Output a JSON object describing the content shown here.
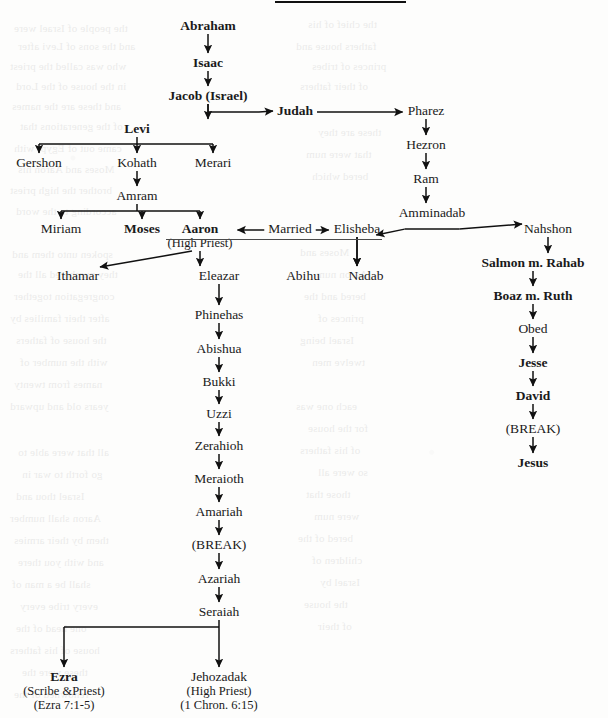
{
  "chart_data": {
    "type": "diagram",
    "nodes": [
      {
        "id": "abraham",
        "label": "Abraham",
        "x": 208,
        "y": 18,
        "bold": true
      },
      {
        "id": "isaac",
        "label": "Isaac",
        "x": 208,
        "y": 55,
        "bold": true
      },
      {
        "id": "jacob",
        "label": "Jacob (Israel)",
        "x": 208,
        "y": 88,
        "bold": true
      },
      {
        "id": "judah",
        "label": "Judah",
        "x": 295,
        "y": 103,
        "bold": true
      },
      {
        "id": "pharez",
        "label": "Pharez",
        "x": 426,
        "y": 103,
        "bold": false
      },
      {
        "id": "hezron",
        "label": "Hezron",
        "x": 426,
        "y": 137,
        "bold": false
      },
      {
        "id": "ram",
        "label": "Ram",
        "x": 426,
        "y": 171,
        "bold": false
      },
      {
        "id": "amminadab",
        "label": "Amminadab",
        "x": 432,
        "y": 205,
        "bold": false
      },
      {
        "id": "levi",
        "label": "Levi",
        "x": 137,
        "y": 121,
        "bold": true
      },
      {
        "id": "gershon",
        "label": "Gershon",
        "x": 39,
        "y": 155,
        "bold": false
      },
      {
        "id": "kohath",
        "label": "Kohath",
        "x": 137,
        "y": 155,
        "bold": false
      },
      {
        "id": "merari",
        "label": "Merari",
        "x": 213,
        "y": 155,
        "bold": false
      },
      {
        "id": "amram",
        "label": "Amram",
        "x": 137,
        "y": 188,
        "bold": false
      },
      {
        "id": "miriam",
        "label": "Miriam",
        "x": 61,
        "y": 221,
        "bold": false
      },
      {
        "id": "moses",
        "label": "Moses",
        "x": 142,
        "y": 221,
        "bold": true
      },
      {
        "id": "aaron",
        "label": "Aaron",
        "sub": "(High Priest)",
        "x": 200,
        "y": 221,
        "bold": true
      },
      {
        "id": "married",
        "label": "Married",
        "x": 290,
        "y": 221,
        "bold": false
      },
      {
        "id": "elisheba",
        "label": "Elisheba",
        "x": 357,
        "y": 221,
        "bold": false
      },
      {
        "id": "nahshon",
        "label": "Nahshon",
        "x": 548,
        "y": 221,
        "bold": false
      },
      {
        "id": "ithamar",
        "label": "Ithamar",
        "x": 78,
        "y": 268,
        "bold": false
      },
      {
        "id": "eleazar",
        "label": "Eleazar",
        "x": 219,
        "y": 268,
        "bold": false
      },
      {
        "id": "abihu",
        "label": "Abihu",
        "x": 303,
        "y": 268,
        "bold": false
      },
      {
        "id": "nadab",
        "label": "Nadab",
        "x": 366,
        "y": 268,
        "bold": false
      },
      {
        "id": "salmon",
        "label": "Salmon m. Rahab",
        "x": 533,
        "y": 255,
        "bold": true
      },
      {
        "id": "boaz",
        "label": "Boaz m. Ruth",
        "x": 533,
        "y": 288,
        "bold": true
      },
      {
        "id": "obed",
        "label": "Obed",
        "x": 533,
        "y": 321,
        "bold": false
      },
      {
        "id": "jesse",
        "label": "Jesse",
        "x": 533,
        "y": 355,
        "bold": true
      },
      {
        "id": "david",
        "label": "David",
        "x": 533,
        "y": 388,
        "bold": true
      },
      {
        "id": "break_d",
        "label": "(BREAK)",
        "x": 533,
        "y": 421,
        "bold": false
      },
      {
        "id": "jesus",
        "label": "Jesus",
        "x": 533,
        "y": 455,
        "bold": true
      },
      {
        "id": "phinehas",
        "label": "Phinehas",
        "x": 219,
        "y": 307,
        "bold": false
      },
      {
        "id": "abishua",
        "label": "Abishua",
        "x": 219,
        "y": 341,
        "bold": false
      },
      {
        "id": "bukki",
        "label": "Bukki",
        "x": 219,
        "y": 374,
        "bold": false
      },
      {
        "id": "uzzi",
        "label": "Uzzi",
        "x": 219,
        "y": 406,
        "bold": false
      },
      {
        "id": "zerahioh",
        "label": "Zerahioh",
        "x": 219,
        "y": 438,
        "bold": false
      },
      {
        "id": "meraioth",
        "label": "Meraioth",
        "x": 219,
        "y": 471,
        "bold": false
      },
      {
        "id": "amariah",
        "label": "Amariah",
        "x": 219,
        "y": 504,
        "bold": false
      },
      {
        "id": "break_p",
        "label": "(BREAK)",
        "x": 219,
        "y": 537,
        "bold": false
      },
      {
        "id": "azariah",
        "label": "Azariah",
        "x": 219,
        "y": 571,
        "bold": false
      },
      {
        "id": "seraiah",
        "label": "Seraiah",
        "x": 219,
        "y": 604,
        "bold": false
      },
      {
        "id": "ezra",
        "label": "Ezra",
        "sub": "(Scribe &Priest)",
        "sub2": "(Ezra 7:1-5)",
        "x": 64,
        "y": 669,
        "bold": true
      },
      {
        "id": "jehozadak",
        "label": "Jehozadak",
        "sub": "(High Priest)",
        "sub2": "(1 Chron. 6:15)",
        "x": 219,
        "y": 669,
        "bold": false
      }
    ],
    "edges": [
      {
        "from": "abraham",
        "to": "isaac",
        "style": "vertical"
      },
      {
        "from": "isaac",
        "to": "jacob",
        "style": "vertical"
      },
      {
        "from": "jacob",
        "to": "levi",
        "style": "vertical"
      },
      {
        "from": "jacob",
        "to": "judah",
        "style": "elbow-diagonal"
      },
      {
        "from": "judah",
        "to": "pharez",
        "style": "horizontal"
      },
      {
        "from": "pharez",
        "to": "hezron",
        "style": "vertical"
      },
      {
        "from": "hezron",
        "to": "ram",
        "style": "vertical"
      },
      {
        "from": "ram",
        "to": "amminadab",
        "style": "vertical"
      },
      {
        "from": "amminadab",
        "to": "elisheba",
        "style": "bus-diagonal"
      },
      {
        "from": "amminadab",
        "to": "nahshon",
        "style": "bus-diagonal"
      },
      {
        "from": "levi",
        "to": "gershon",
        "style": "bus"
      },
      {
        "from": "levi",
        "to": "kohath",
        "style": "bus"
      },
      {
        "from": "levi",
        "to": "merari",
        "style": "bus"
      },
      {
        "from": "kohath",
        "to": "amram",
        "style": "vertical"
      },
      {
        "from": "amram",
        "to": "miriam",
        "style": "bus"
      },
      {
        "from": "amram",
        "to": "moses",
        "style": "bus"
      },
      {
        "from": "amram",
        "to": "aaron",
        "style": "bus"
      },
      {
        "from": "married",
        "to": "aaron",
        "style": "horizontal-left"
      },
      {
        "from": "married",
        "to": "elisheba",
        "style": "horizontal"
      },
      {
        "from": "aaron",
        "to": "ithamar",
        "style": "diagonal"
      },
      {
        "from": "aaron",
        "to": "eleazar",
        "style": "vertical"
      },
      {
        "from": "elisheba",
        "to": "abihu",
        "style": "vertical"
      },
      {
        "from": "elisheba",
        "to": "nadab",
        "style": "vertical"
      },
      {
        "from": "nahshon",
        "to": "salmon",
        "style": "vertical"
      },
      {
        "from": "salmon",
        "to": "boaz",
        "style": "vertical"
      },
      {
        "from": "boaz",
        "to": "obed",
        "style": "vertical"
      },
      {
        "from": "obed",
        "to": "jesse",
        "style": "vertical"
      },
      {
        "from": "jesse",
        "to": "david",
        "style": "vertical"
      },
      {
        "from": "david",
        "to": "break_d",
        "style": "vertical"
      },
      {
        "from": "break_d",
        "to": "jesus",
        "style": "vertical"
      },
      {
        "from": "eleazar",
        "to": "phinehas",
        "style": "vertical"
      },
      {
        "from": "phinehas",
        "to": "abishua",
        "style": "vertical"
      },
      {
        "from": "abishua",
        "to": "bukki",
        "style": "vertical"
      },
      {
        "from": "bukki",
        "to": "uzzi",
        "style": "vertical"
      },
      {
        "from": "uzzi",
        "to": "zerahioh",
        "style": "vertical"
      },
      {
        "from": "zerahioh",
        "to": "meraioth",
        "style": "vertical"
      },
      {
        "from": "meraioth",
        "to": "amariah",
        "style": "vertical"
      },
      {
        "from": "amariah",
        "to": "break_p",
        "style": "vertical"
      },
      {
        "from": "break_p",
        "to": "azariah",
        "style": "vertical"
      },
      {
        "from": "azariah",
        "to": "seraiah",
        "style": "vertical"
      },
      {
        "from": "seraiah",
        "to": "ezra",
        "style": "bus"
      },
      {
        "from": "seraiah",
        "to": "jehozadak",
        "style": "bus"
      }
    ]
  },
  "background": {
    "bleed_lines": [
      {
        "text": "the people of Israel were",
        "x": 14,
        "y": 22
      },
      {
        "text": "and the sons of Levi after",
        "x": 18,
        "y": 40
      },
      {
        "text": "who was called the priest",
        "x": 10,
        "y": 60
      },
      {
        "text": "in the house of the Lord",
        "x": 16,
        "y": 80
      },
      {
        "text": "and these are the names",
        "x": 12,
        "y": 100
      },
      {
        "text": "of the generations that",
        "x": 20,
        "y": 120
      },
      {
        "text": "came out of Egypt with",
        "x": 14,
        "y": 142
      },
      {
        "text": "Moses and Aaron his",
        "x": 18,
        "y": 163
      },
      {
        "text": "brother the high priest",
        "x": 10,
        "y": 184
      },
      {
        "text": "according to the word",
        "x": 16,
        "y": 205
      },
      {
        "text": "spoken unto them and",
        "x": 12,
        "y": 248
      },
      {
        "text": "they numbered all the",
        "x": 18,
        "y": 268
      },
      {
        "text": "congregation together",
        "x": 14,
        "y": 290
      },
      {
        "text": "after their families by",
        "x": 10,
        "y": 312
      },
      {
        "text": "the house of fathers",
        "x": 16,
        "y": 334
      },
      {
        "text": "with the number of",
        "x": 20,
        "y": 356
      },
      {
        "text": "names from twenty",
        "x": 14,
        "y": 378
      },
      {
        "text": "years old and upward",
        "x": 10,
        "y": 400
      },
      {
        "text": "all that were able to",
        "x": 18,
        "y": 446
      },
      {
        "text": "go forth to war in",
        "x": 22,
        "y": 468
      },
      {
        "text": "Israel thou and",
        "x": 16,
        "y": 490
      },
      {
        "text": "Aaron shall number",
        "x": 10,
        "y": 512
      },
      {
        "text": "them by their armies",
        "x": 14,
        "y": 534
      },
      {
        "text": "and with you there",
        "x": 18,
        "y": 556
      },
      {
        "text": "shall be a man of",
        "x": 12,
        "y": 578
      },
      {
        "text": "every tribe every",
        "x": 20,
        "y": 600
      },
      {
        "text": "one head of the",
        "x": 16,
        "y": 622
      },
      {
        "text": "house of his fathers",
        "x": 10,
        "y": 644
      },
      {
        "text": "these were the",
        "x": 22,
        "y": 666
      },
      {
        "text": "renowned of the",
        "x": 14,
        "y": 688
      },
      {
        "text": "the chief of his",
        "x": 308,
        "y": 18
      },
      {
        "text": "fathers house and",
        "x": 296,
        "y": 40
      },
      {
        "text": "princes of tribes",
        "x": 312,
        "y": 60
      },
      {
        "text": "of their fathers",
        "x": 300,
        "y": 80
      },
      {
        "text": "these are they",
        "x": 318,
        "y": 126
      },
      {
        "text": "that were num",
        "x": 306,
        "y": 148
      },
      {
        "text": "bered which",
        "x": 312,
        "y": 170
      },
      {
        "text": "Moses and",
        "x": 300,
        "y": 246
      },
      {
        "text": "Aaron num",
        "x": 316,
        "y": 268
      },
      {
        "text": "bered and the",
        "x": 304,
        "y": 290
      },
      {
        "text": "princes of",
        "x": 318,
        "y": 312
      },
      {
        "text": "Israel being",
        "x": 300,
        "y": 334
      },
      {
        "text": "twelve men",
        "x": 312,
        "y": 356
      },
      {
        "text": "each one was",
        "x": 296,
        "y": 400
      },
      {
        "text": "for the house",
        "x": 308,
        "y": 422
      },
      {
        "text": "of his fathers",
        "x": 300,
        "y": 444
      },
      {
        "text": "so were all",
        "x": 318,
        "y": 466
      },
      {
        "text": "those that",
        "x": 306,
        "y": 488
      },
      {
        "text": "were num",
        "x": 314,
        "y": 510
      },
      {
        "text": "bered of the",
        "x": 298,
        "y": 532
      },
      {
        "text": "children of",
        "x": 312,
        "y": 554
      },
      {
        "text": "Israel by",
        "x": 320,
        "y": 576
      },
      {
        "text": "the house",
        "x": 304,
        "y": 598
      },
      {
        "text": "of their",
        "x": 318,
        "y": 620
      }
    ]
  }
}
